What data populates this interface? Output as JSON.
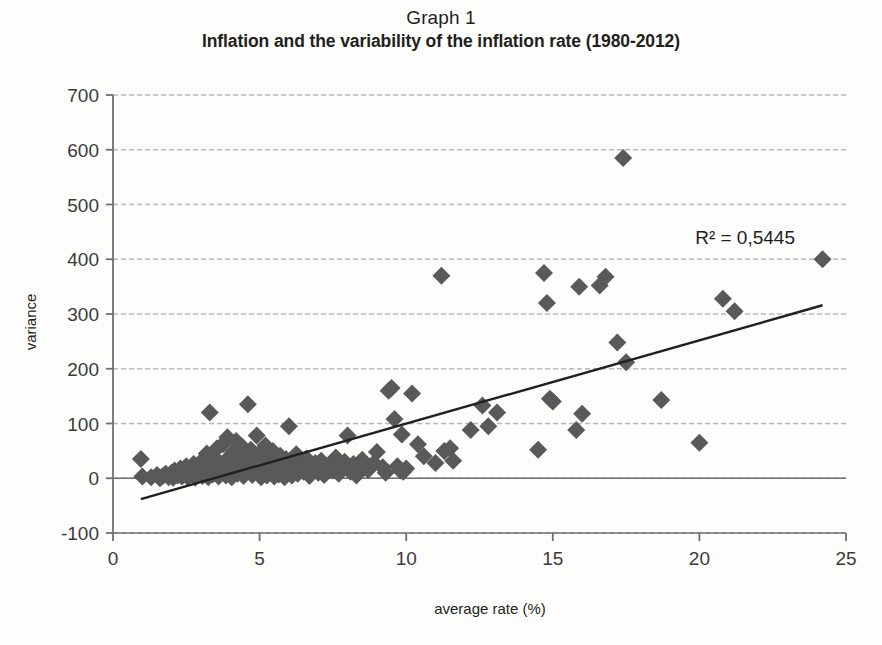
{
  "title": {
    "line1": "Graph 1",
    "line2": "Inflation and the variability of the inflation rate (1980-2012)"
  },
  "annotation": {
    "r2": "R² = 0,5445"
  },
  "colors": {
    "marker": "#595959",
    "trendline": "#231f20",
    "gridline": "#b8b8b8",
    "axis": "#6f6f6f",
    "background": "#fdfdfb",
    "text": "#231f20"
  },
  "chart_data": {
    "type": "scatter",
    "title": "Inflation and the variability of the inflation rate (1980-2012)",
    "subtitle": "Graph 1",
    "xlabel": "average rate (%)",
    "ylabel": "variance",
    "xlim": [
      0,
      25
    ],
    "ylim": [
      -100,
      700
    ],
    "xticks": [
      0,
      5,
      10,
      15,
      20,
      25
    ],
    "yticks": [
      -100,
      0,
      100,
      200,
      300,
      400,
      500,
      600,
      700
    ],
    "grid": "horizontal-dashed",
    "legend": "none",
    "annotations": [
      {
        "text": "R² = 0,5445",
        "x": 19.5,
        "y": 415
      }
    ],
    "trendline": {
      "type": "linear",
      "r_squared": 0.5445,
      "x_start": 0.95,
      "y_start": -38,
      "x_end": 24.2,
      "y_end": 316
    },
    "marker": {
      "shape": "diamond",
      "size": 9,
      "color": "#595959"
    },
    "points": [
      [
        0.95,
        35
      ],
      [
        1.0,
        3
      ],
      [
        1.3,
        2
      ],
      [
        1.5,
        6
      ],
      [
        1.6,
        0
      ],
      [
        1.7,
        4
      ],
      [
        1.8,
        8
      ],
      [
        1.9,
        2
      ],
      [
        2.0,
        10
      ],
      [
        2.05,
        1
      ],
      [
        2.1,
        14
      ],
      [
        2.2,
        5
      ],
      [
        2.3,
        18
      ],
      [
        2.35,
        3
      ],
      [
        2.4,
        9
      ],
      [
        2.5,
        22
      ],
      [
        2.55,
        2
      ],
      [
        2.6,
        12
      ],
      [
        2.7,
        6
      ],
      [
        2.75,
        26
      ],
      [
        2.8,
        1
      ],
      [
        2.9,
        16
      ],
      [
        2.95,
        8
      ],
      [
        3.0,
        30
      ],
      [
        3.05,
        4
      ],
      [
        3.1,
        20
      ],
      [
        3.15,
        11
      ],
      [
        3.2,
        45
      ],
      [
        3.25,
        2
      ],
      [
        3.3,
        120
      ],
      [
        3.35,
        24
      ],
      [
        3.4,
        7
      ],
      [
        3.45,
        34
      ],
      [
        3.5,
        15
      ],
      [
        3.55,
        55
      ],
      [
        3.6,
        3
      ],
      [
        3.65,
        28
      ],
      [
        3.7,
        10
      ],
      [
        3.75,
        62
      ],
      [
        3.8,
        19
      ],
      [
        3.85,
        5
      ],
      [
        3.9,
        75
      ],
      [
        3.95,
        38
      ],
      [
        4.0,
        12
      ],
      [
        4.05,
        2
      ],
      [
        4.1,
        48
      ],
      [
        4.15,
        23
      ],
      [
        4.2,
        68
      ],
      [
        4.25,
        8
      ],
      [
        4.3,
        31
      ],
      [
        4.35,
        17
      ],
      [
        4.4,
        58
      ],
      [
        4.45,
        4
      ],
      [
        4.5,
        42
      ],
      [
        4.55,
        26
      ],
      [
        4.6,
        135
      ],
      [
        4.65,
        13
      ],
      [
        4.7,
        52
      ],
      [
        4.75,
        6
      ],
      [
        4.8,
        36
      ],
      [
        4.85,
        21
      ],
      [
        4.9,
        78
      ],
      [
        4.95,
        9
      ],
      [
        5.0,
        45
      ],
      [
        5.05,
        2
      ],
      [
        5.1,
        29
      ],
      [
        5.15,
        16
      ],
      [
        5.2,
        60
      ],
      [
        5.25,
        5
      ],
      [
        5.3,
        38
      ],
      [
        5.35,
        24
      ],
      [
        5.4,
        11
      ],
      [
        5.45,
        50
      ],
      [
        5.5,
        3
      ],
      [
        5.55,
        33
      ],
      [
        5.6,
        19
      ],
      [
        5.65,
        7
      ],
      [
        5.7,
        41
      ],
      [
        5.75,
        14
      ],
      [
        5.8,
        26
      ],
      [
        5.85,
        2
      ],
      [
        5.9,
        35
      ],
      [
        5.95,
        9
      ],
      [
        6.0,
        95
      ],
      [
        6.05,
        21
      ],
      [
        6.1,
        5
      ],
      [
        6.15,
        30
      ],
      [
        6.2,
        16
      ],
      [
        6.25,
        44
      ],
      [
        6.3,
        8
      ],
      [
        6.4,
        25
      ],
      [
        6.5,
        12
      ],
      [
        6.6,
        36
      ],
      [
        6.7,
        4
      ],
      [
        6.8,
        20
      ],
      [
        6.9,
        28
      ],
      [
        7.0,
        10
      ],
      [
        7.1,
        32
      ],
      [
        7.2,
        6
      ],
      [
        7.3,
        18
      ],
      [
        7.4,
        24
      ],
      [
        7.5,
        14
      ],
      [
        7.6,
        38
      ],
      [
        7.7,
        8
      ],
      [
        7.8,
        22
      ],
      [
        7.9,
        30
      ],
      [
        8.0,
        78
      ],
      [
        8.1,
        12
      ],
      [
        8.2,
        26
      ],
      [
        8.3,
        5
      ],
      [
        8.4,
        20
      ],
      [
        8.5,
        34
      ],
      [
        8.7,
        15
      ],
      [
        8.9,
        28
      ],
      [
        9.0,
        48
      ],
      [
        9.2,
        20
      ],
      [
        9.3,
        10
      ],
      [
        9.4,
        160
      ],
      [
        9.5,
        165
      ],
      [
        9.6,
        108
      ],
      [
        9.7,
        22
      ],
      [
        9.8,
        14
      ],
      [
        9.85,
        80
      ],
      [
        9.9,
        12
      ],
      [
        10.0,
        18
      ],
      [
        10.2,
        155
      ],
      [
        10.4,
        62
      ],
      [
        10.6,
        40
      ],
      [
        11.0,
        28
      ],
      [
        11.2,
        370
      ],
      [
        11.3,
        50
      ],
      [
        11.5,
        55
      ],
      [
        11.6,
        32
      ],
      [
        12.2,
        88
      ],
      [
        12.6,
        133
      ],
      [
        12.8,
        95
      ],
      [
        13.1,
        120
      ],
      [
        14.5,
        52
      ],
      [
        14.7,
        375
      ],
      [
        14.8,
        320
      ],
      [
        14.9,
        145
      ],
      [
        15.0,
        140
      ],
      [
        15.8,
        88
      ],
      [
        15.9,
        350
      ],
      [
        16.0,
        118
      ],
      [
        16.6,
        352
      ],
      [
        16.8,
        368
      ],
      [
        17.2,
        248
      ],
      [
        17.4,
        585
      ],
      [
        17.5,
        212
      ],
      [
        18.7,
        143
      ],
      [
        20.0,
        65
      ],
      [
        20.8,
        328
      ],
      [
        21.2,
        305
      ],
      [
        24.2,
        400
      ]
    ]
  }
}
